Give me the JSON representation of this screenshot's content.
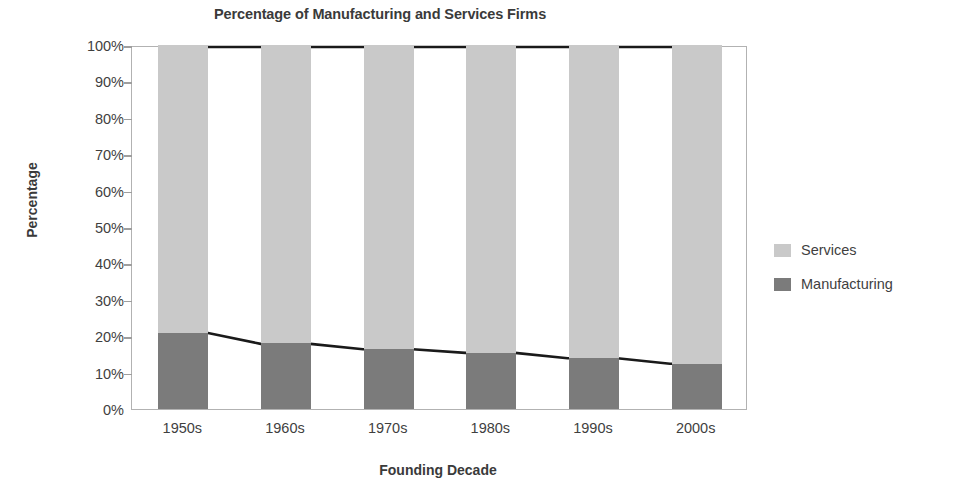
{
  "chart_data": {
    "type": "bar",
    "title": "Percentage of Manufacturing and Services Firms",
    "xlabel": "Founding Decade",
    "ylabel": "Percentage",
    "categories": [
      "1950s",
      "1960s",
      "1970s",
      "1980s",
      "1990s",
      "2000s"
    ],
    "series": [
      {
        "name": "Manufacturing",
        "color": "#7b7b7b",
        "values": [
          21,
          18,
          16.5,
          15.5,
          14,
          12.5
        ]
      },
      {
        "name": "Services",
        "color": "#c9c9c9",
        "values": [
          79,
          82,
          83.5,
          84.5,
          86,
          87.5
        ]
      }
    ],
    "stacked": true,
    "ylim": [
      0,
      100
    ],
    "yticks": [
      "0%",
      "10%",
      "20%",
      "30%",
      "40%",
      "50%",
      "60%",
      "70%",
      "80%",
      "90%",
      "100%"
    ],
    "ytick_values": [
      0,
      10,
      20,
      30,
      40,
      50,
      60,
      70,
      80,
      90,
      100
    ],
    "grid": false,
    "legend_position": "right",
    "overlay_lines": [
      {
        "name": "manufacturing-top-line",
        "color": "#1a1a1a",
        "values": [
          21,
          18,
          16.5,
          15.5,
          14,
          12.5
        ]
      },
      {
        "name": "total-top-line",
        "color": "#1a1a1a",
        "values": [
          100,
          100,
          100,
          100,
          100,
          100
        ]
      }
    ]
  },
  "legend": {
    "items": [
      {
        "label": "Services",
        "color": "#c9c9c9"
      },
      {
        "label": "Manufacturing",
        "color": "#7b7b7b"
      }
    ]
  }
}
